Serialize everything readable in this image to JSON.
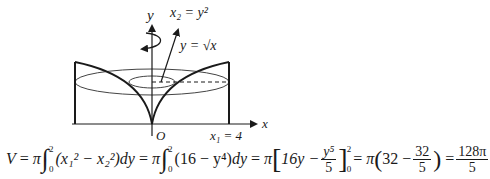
{
  "diagram": {
    "y_axis_label": "y",
    "x_axis_label": "x",
    "origin_label": "O",
    "curve_label_x2": "x₂ = y²",
    "curve_label_sqrt": "y = √x",
    "boundary_label": "x₁ = 4",
    "rotation_axis": "y-axis",
    "colors": {
      "stroke": "#1a1a1a",
      "ellipse": "#444444"
    }
  },
  "formula": {
    "lhs": "V",
    "eq": "=",
    "pi": "π",
    "integral": "∫",
    "lower": "0",
    "upper": "2",
    "integrand1": "(x₁² − x₂²)",
    "dy": "dy",
    "integrand2": "(16 − y⁴)",
    "antideriv_a": "16y −",
    "antideriv_num": "y⁵",
    "antideriv_den": "5",
    "eval_upper": "2",
    "eval_lower": "0",
    "step3_a": "32 −",
    "step3_num": "32",
    "step3_den": "5",
    "result_num": "128π",
    "result_den": "5"
  }
}
